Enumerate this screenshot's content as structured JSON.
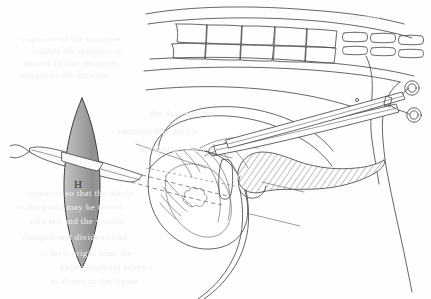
{
  "figure": {
    "domain": "anatomical-surgical-line-drawing",
    "caption_label": "H",
    "labels": [
      {
        "id": "H",
        "text": "H",
        "x": 78,
        "y": 188
      }
    ],
    "colors": {
      "ink": "#4a4a4a",
      "ink_light": "#6a6a6a",
      "paper": "#fefefe",
      "lens_light": "#d8d8d8",
      "lens_dark": "#8d8d8d",
      "hatch": "#555555",
      "ghost_text": "#f0f0f0"
    },
    "elements": {
      "lens_shape_name": "gray lens vesica marker",
      "probe_name": "tubular drain instrument",
      "forceps_name": "ring-handled surgical forceps",
      "hatched_organ_name": "hatched elongated organ",
      "spine_name": "segmented vertebral column",
      "gallbladder_name": "rounded viscus"
    },
    "ghost_text_lines": [
      {
        "text": "operative",
        "x": 345,
        "y": 12
      },
      {
        "text": "exposure  of   the  structure",
        "x": 22,
        "y": 34
      },
      {
        "text": "visible  the  retractor  is",
        "x": 34,
        "y": 46
      },
      {
        "text": "placed  so  that  the  upper",
        "x": 24,
        "y": 58
      },
      {
        "text": "margin  of  the  incision",
        "x": 20,
        "y": 70
      },
      {
        "text": "the   duct   and  the",
        "x": 150,
        "y": 108
      },
      {
        "text": "common  bile  duct  is",
        "x": 118,
        "y": 126
      },
      {
        "text": "divided   between",
        "x": 140,
        "y": 144
      },
      {
        "text": "ligatures  so  that  the  whole",
        "x": 28,
        "y": 188
      },
      {
        "text": "of  the  gland  may  be  turned",
        "x": 16,
        "y": 202
      },
      {
        "text": "forward   and   the   vessels",
        "x": 30,
        "y": 216
      },
      {
        "text": "clamped  and  divided  close",
        "x": 22,
        "y": 232
      },
      {
        "text": "to  their  origin  from  the",
        "x": 40,
        "y": 248
      },
      {
        "text": "gastroduodenal  artery",
        "x": 60,
        "y": 262
      },
      {
        "text": "as  shown  in  the  figure",
        "x": 50,
        "y": 276
      }
    ]
  }
}
